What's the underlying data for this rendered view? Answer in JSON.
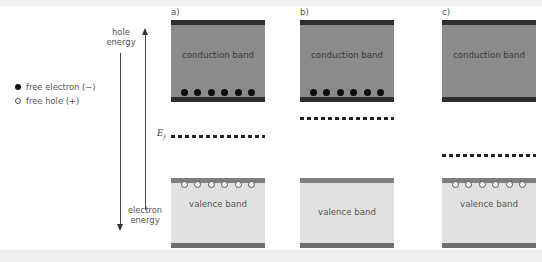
{
  "legend": {
    "electron": "free electron (−)",
    "hole": "free hole (+)"
  },
  "axes": {
    "hole_energy": [
      "hole",
      "energy"
    ],
    "electron_energy": [
      "electron",
      "energy"
    ],
    "fermi_symbol": "E",
    "fermi_subscript": "f"
  },
  "panels": [
    {
      "label": "a)",
      "conduction": "conduction band",
      "valence": "valence band",
      "electrons": 6,
      "holes": 6,
      "fermi_y": 136
    },
    {
      "label": "b)",
      "conduction": "conduction band",
      "valence": "valence band",
      "electrons": 6,
      "holes": 0,
      "fermi_y": 118
    },
    {
      "label": "c)",
      "conduction": "conduction band",
      "valence": "valence band",
      "electrons": 0,
      "holes": 6,
      "fermi_y": 155
    }
  ],
  "colors": {
    "conduction_fill": "#8b8b8b",
    "conduction_edge": "#2e2e2e",
    "valence_fill": "#e1e1e1",
    "valence_edge": "#7f7f7f"
  }
}
